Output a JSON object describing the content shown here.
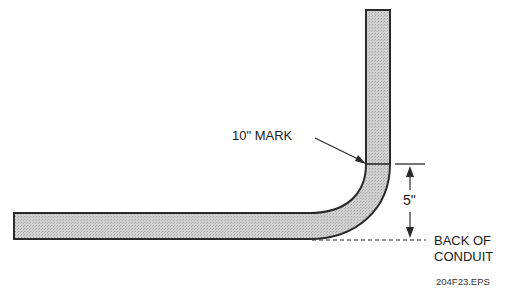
{
  "diagram": {
    "type": "conduit-bend-illustration",
    "labels": {
      "mark": "10\" MARK",
      "dimension": "5\"",
      "back_of_conduit_line1": "BACK OF",
      "back_of_conduit_line2": "CONDUIT",
      "file_id": "204F23.EPS"
    },
    "colors": {
      "conduit_fill": "#c9c9c9",
      "outline": "#2a2a2a",
      "background": "#ffffff"
    },
    "geometry": {
      "horizontal_leg": {
        "x_start": 14,
        "x_end": 310,
        "y_top": 213,
        "y_bottom": 239
      },
      "vertical_leg": {
        "x_left": 366,
        "x_right": 390,
        "y_top": 10,
        "y_bottom": 164
      },
      "mark_line_y": 164,
      "dimension_arrow_x": 410,
      "dimension_top_y": 164,
      "dimension_bottom_y": 239
    }
  }
}
